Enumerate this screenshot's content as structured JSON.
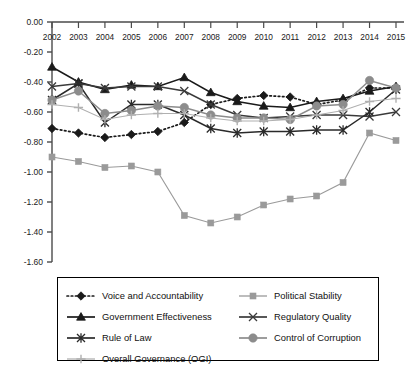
{
  "chart_data": {
    "type": "line",
    "title": "",
    "subtitle": "",
    "xlabel": "",
    "ylabel": "",
    "x": [
      2002,
      2003,
      2004,
      2005,
      2006,
      2007,
      2008,
      2009,
      2010,
      2011,
      2012,
      2013,
      2014,
      2015
    ],
    "categories": [
      "2002",
      "2003",
      "2004",
      "2005",
      "2006",
      "2007",
      "2008",
      "2009",
      "2010",
      "2011",
      "2012",
      "2013",
      "2014",
      "2015"
    ],
    "xlim": [
      2002,
      2015
    ],
    "ylim": [
      -1.6,
      0.0
    ],
    "yticks": [
      0.0,
      -0.2,
      -0.4,
      -0.6,
      -0.8,
      -1.0,
      -1.2,
      -1.4,
      -1.6
    ],
    "ytick_labels": [
      "0.00",
      "-0.20",
      "-0.40",
      "-0.60",
      "-0.80",
      "-1.00",
      "-1.20",
      "-1.40",
      "-1.60"
    ],
    "grid": false,
    "xaxis_position": "top",
    "legend_position": "bottom",
    "series": [
      {
        "name": "Voice and Accountability",
        "color": "#1a1a1a",
        "line_style": "dotted",
        "marker": "diamond",
        "values": [
          -0.71,
          -0.74,
          -0.77,
          -0.75,
          -0.73,
          -0.67,
          -0.55,
          -0.51,
          -0.49,
          -0.5,
          -0.55,
          -0.52,
          -0.44,
          -0.44
        ]
      },
      {
        "name": "Political Stability",
        "color": "#9a9a9a",
        "line_style": "solid",
        "marker": "square",
        "values": [
          -0.9,
          -0.93,
          -0.97,
          -0.96,
          -1.0,
          -1.29,
          -1.34,
          -1.3,
          -1.22,
          -1.18,
          -1.16,
          -1.07,
          -0.74,
          -0.79
        ]
      },
      {
        "name": "Government Effectiveness",
        "color": "#1a1a1a",
        "line_style": "solid",
        "marker": "triangle",
        "values": [
          -0.3,
          -0.4,
          -0.45,
          -0.42,
          -0.43,
          -0.37,
          -0.47,
          -0.53,
          -0.56,
          -0.57,
          -0.53,
          -0.51,
          -0.46,
          -0.43
        ]
      },
      {
        "name": "Regulatory Quality",
        "color": "#3a3a3a",
        "line_style": "solid",
        "marker": "x-bar",
        "values": [
          -0.43,
          -0.41,
          -0.44,
          -0.43,
          -0.43,
          -0.46,
          -0.55,
          -0.62,
          -0.64,
          -0.63,
          -0.62,
          -0.62,
          -0.63,
          -0.6
        ]
      },
      {
        "name": "Rule of Law",
        "color": "#2a2a2a",
        "line_style": "solid",
        "marker": "asterisk",
        "values": [
          -0.52,
          -0.41,
          -0.67,
          -0.55,
          -0.55,
          -0.62,
          -0.71,
          -0.74,
          -0.73,
          -0.73,
          -0.72,
          -0.72,
          -0.6,
          -0.45
        ]
      },
      {
        "name": "Control of Corruption",
        "color": "#8c8c8c",
        "line_style": "solid",
        "marker": "circle",
        "values": [
          -0.52,
          -0.46,
          -0.61,
          -0.59,
          -0.56,
          -0.57,
          -0.62,
          -0.64,
          -0.64,
          -0.65,
          -0.56,
          -0.55,
          -0.39,
          -0.44
        ]
      },
      {
        "name": "Overall Governance (OGI)",
        "color": "#b0b0b0",
        "line_style": "solid",
        "marker": "plus",
        "values": [
          -0.55,
          -0.57,
          -0.65,
          -0.62,
          -0.61,
          -0.61,
          -0.64,
          -0.66,
          -0.66,
          -0.65,
          -0.62,
          -0.59,
          -0.53,
          -0.51
        ]
      }
    ]
  },
  "legend": {
    "rows": [
      [
        {
          "label": "Voice and Accountability",
          "series": 0
        },
        {
          "label": "Political Stability",
          "series": 1
        }
      ],
      [
        {
          "label": "Government Effectiveness",
          "series": 2
        },
        {
          "label": "Regulatory Quality",
          "series": 3
        }
      ],
      [
        {
          "label": "Rule of Law",
          "series": 4
        },
        {
          "label": "Control of Corruption",
          "series": 5
        }
      ],
      [
        {
          "label": "Overall Governance (OGI)",
          "series": 6
        }
      ]
    ]
  }
}
